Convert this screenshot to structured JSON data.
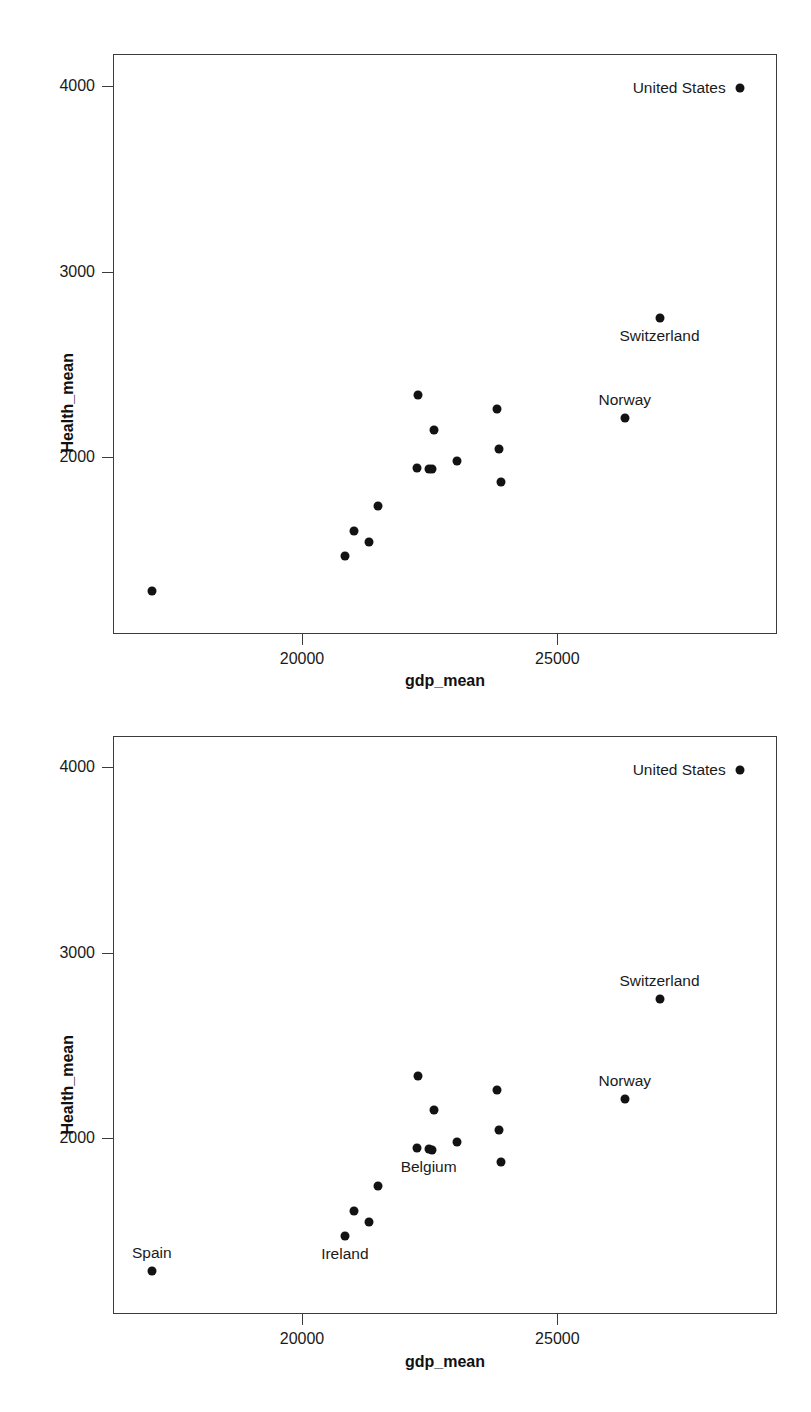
{
  "figure": {
    "panel_count": 2,
    "background_color": "#ffffff",
    "marker_color": "#121212",
    "axis_color": "#3c3c3c"
  },
  "chart_data": [
    {
      "id": "panel-top",
      "type": "scatter",
      "title": "",
      "xlabel": "gdp_mean",
      "ylabel": "Health_mean",
      "xlim": [
        16300,
        29300
      ],
      "ylim": [
        1050,
        4170
      ],
      "xticks": [
        20000,
        25000
      ],
      "xticklabels": [
        "20000",
        "25000"
      ],
      "yticks": [
        2000,
        3000,
        4000
      ],
      "yticklabels": [
        "2000",
        "3000",
        "4000"
      ],
      "grid": false,
      "legend": "none",
      "points": [
        {
          "label": "United States",
          "x": 28550,
          "y": 3990,
          "label_pos": "left"
        },
        {
          "label": "Switzerland",
          "x": 26980,
          "y": 2755,
          "label_pos": "below"
        },
        {
          "label": "Norway",
          "x": 26300,
          "y": 2215,
          "label_pos": "above"
        },
        {
          "label": "",
          "x": 22260,
          "y": 2340,
          "label_pos": "none"
        },
        {
          "label": "",
          "x": 23800,
          "y": 2265,
          "label_pos": "none"
        },
        {
          "label": "",
          "x": 22560,
          "y": 2155,
          "label_pos": "none"
        },
        {
          "label": "",
          "x": 23830,
          "y": 2050,
          "label_pos": "none"
        },
        {
          "label": "",
          "x": 23010,
          "y": 1985,
          "label_pos": "none"
        },
        {
          "label": "",
          "x": 22240,
          "y": 1950,
          "label_pos": "none"
        },
        {
          "label": "Belgium",
          "x": 22460,
          "y": 1945,
          "label_pos": "none"
        },
        {
          "label": "",
          "x": 22520,
          "y": 1943,
          "label_pos": "none"
        },
        {
          "label": "",
          "x": 23880,
          "y": 1875,
          "label_pos": "none"
        },
        {
          "label": "",
          "x": 21470,
          "y": 1745,
          "label_pos": "none"
        },
        {
          "label": "",
          "x": 21000,
          "y": 1610,
          "label_pos": "none"
        },
        {
          "label": "",
          "x": 21290,
          "y": 1550,
          "label_pos": "none"
        },
        {
          "label": "Ireland",
          "x": 20820,
          "y": 1475,
          "label_pos": "none"
        },
        {
          "label": "Spain",
          "x": 17040,
          "y": 1285,
          "label_pos": "none"
        }
      ]
    },
    {
      "id": "panel-bottom",
      "type": "scatter",
      "title": "",
      "xlabel": "gdp_mean",
      "ylabel": "Health_mean",
      "xlim": [
        16300,
        29300
      ],
      "ylim": [
        1050,
        4170
      ],
      "xticks": [
        20000,
        25000
      ],
      "xticklabels": [
        "20000",
        "25000"
      ],
      "yticks": [
        2000,
        3000,
        4000
      ],
      "yticklabels": [
        "2000",
        "3000",
        "4000"
      ],
      "grid": false,
      "legend": "none",
      "points": [
        {
          "label": "United States",
          "x": 28550,
          "y": 3990,
          "label_pos": "left"
        },
        {
          "label": "Switzerland",
          "x": 26980,
          "y": 2755,
          "label_pos": "above"
        },
        {
          "label": "Norway",
          "x": 26300,
          "y": 2215,
          "label_pos": "above"
        },
        {
          "label": "",
          "x": 22260,
          "y": 2340,
          "label_pos": "none"
        },
        {
          "label": "",
          "x": 23800,
          "y": 2265,
          "label_pos": "none"
        },
        {
          "label": "",
          "x": 22560,
          "y": 2155,
          "label_pos": "none"
        },
        {
          "label": "",
          "x": 23830,
          "y": 2050,
          "label_pos": "none"
        },
        {
          "label": "",
          "x": 23010,
          "y": 1985,
          "label_pos": "none"
        },
        {
          "label": "",
          "x": 22240,
          "y": 1950,
          "label_pos": "none"
        },
        {
          "label": "Belgium",
          "x": 22460,
          "y": 1945,
          "label_pos": "below"
        },
        {
          "label": "",
          "x": 22520,
          "y": 1943,
          "label_pos": "none"
        },
        {
          "label": "",
          "x": 23880,
          "y": 1875,
          "label_pos": "none"
        },
        {
          "label": "",
          "x": 21470,
          "y": 1745,
          "label_pos": "none"
        },
        {
          "label": "",
          "x": 21000,
          "y": 1610,
          "label_pos": "none"
        },
        {
          "label": "",
          "x": 21290,
          "y": 1550,
          "label_pos": "none"
        },
        {
          "label": "Ireland",
          "x": 20820,
          "y": 1475,
          "label_pos": "below"
        },
        {
          "label": "Spain",
          "x": 17040,
          "y": 1285,
          "label_pos": "above"
        }
      ]
    }
  ]
}
